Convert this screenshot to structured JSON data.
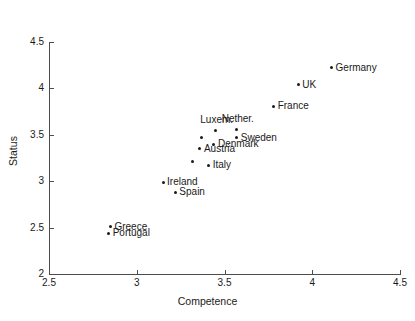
{
  "chart_data": {
    "type": "scatter",
    "title": "",
    "xlabel": "Competence",
    "ylabel": "Status",
    "xlim": [
      2.5,
      4.5
    ],
    "ylim": [
      2,
      4.5
    ],
    "xticks": [
      "2.5",
      "3",
      "3.5",
      "4",
      "4.5"
    ],
    "yticks": [
      "2",
      "2.5",
      "3",
      "3.5",
      "4",
      "4.5"
    ],
    "grid": false,
    "legend": "none",
    "marker_color": "#1a1a1a",
    "axis_color": "#4d4d4d",
    "points": [
      {
        "label": "Germany",
        "x": 4.11,
        "y": 4.22,
        "label_pos": "right"
      },
      {
        "label": "UK",
        "x": 3.92,
        "y": 4.04,
        "label_pos": "right"
      },
      {
        "label": "France",
        "x": 3.78,
        "y": 3.81,
        "label_pos": "right"
      },
      {
        "label": "Luxem.",
        "x": 3.45,
        "y": 3.55,
        "label_pos": "above"
      },
      {
        "label": "Nether.",
        "x": 3.57,
        "y": 3.56,
        "label_pos": "above"
      },
      {
        "label": "Sweden",
        "x": 3.57,
        "y": 3.47,
        "label_pos": "right"
      },
      {
        "label": "Belgium",
        "x": 3.37,
        "y": 3.47,
        "label_pos": "left"
      },
      {
        "label": "Denmark",
        "x": 3.44,
        "y": 3.4,
        "label_pos": "right"
      },
      {
        "label": "Austria",
        "x": 3.36,
        "y": 3.35,
        "label_pos": "right"
      },
      {
        "label": "Finland",
        "x": 3.32,
        "y": 3.21,
        "label_pos": "left"
      },
      {
        "label": "Italy",
        "x": 3.41,
        "y": 3.17,
        "label_pos": "right"
      },
      {
        "label": "Ireland",
        "x": 3.15,
        "y": 2.99,
        "label_pos": "right"
      },
      {
        "label": "Spain",
        "x": 3.22,
        "y": 2.88,
        "label_pos": "right"
      },
      {
        "label": "Greece",
        "x": 2.85,
        "y": 2.51,
        "label_pos": "right"
      },
      {
        "label": "Portugal",
        "x": 2.84,
        "y": 2.44,
        "label_pos": "right"
      }
    ]
  }
}
